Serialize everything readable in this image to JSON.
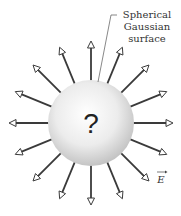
{
  "figure": {
    "center_symbol": "?",
    "surface_label_lines": [
      "Spherical",
      "Gaussian",
      "surface"
    ],
    "field_label": "E",
    "arrow_count": 16,
    "colors": {
      "arrow": "#3a3a3a",
      "sphere_light": "#ffffff",
      "sphere_dark": "#c8c8c8",
      "text": "#333333"
    }
  }
}
